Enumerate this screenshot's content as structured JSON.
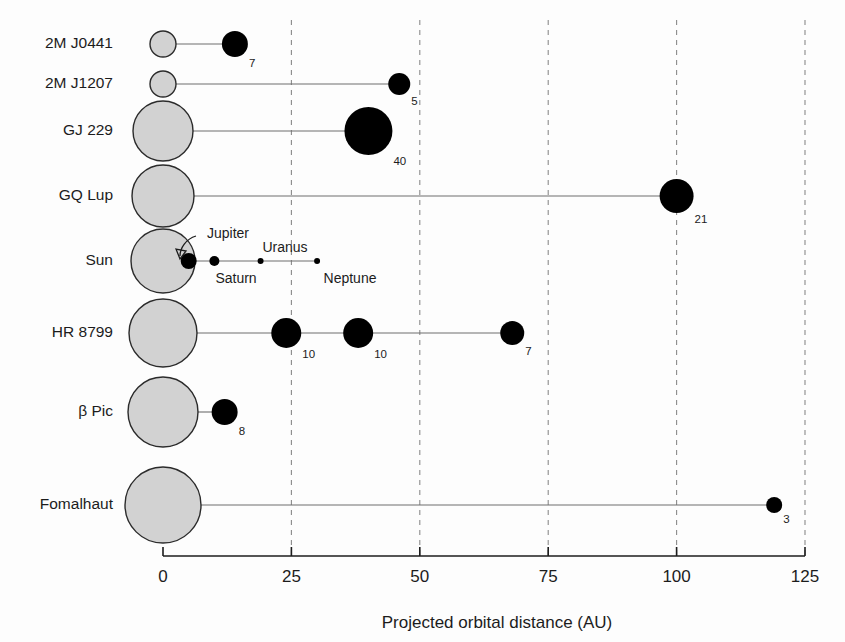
{
  "chart_data": {
    "type": "scatter",
    "title": "",
    "xlabel": "Projected orbital distance (AU)",
    "ylabel": "",
    "xlim": [
      0,
      125
    ],
    "xticks": [
      0,
      25,
      50,
      75,
      100,
      125
    ],
    "xticklabels": [
      "0",
      "25",
      "50",
      "75",
      "100",
      "125"
    ],
    "gridlines": [
      25,
      50,
      75,
      100,
      125
    ],
    "grid": true,
    "legend": "none",
    "categories": [
      "2M J0441",
      "2M J1207",
      "GJ 229",
      "GQ Lup",
      "Sun",
      "HR 8799",
      "β Pic",
      "Fomalhaut"
    ],
    "series": [
      {
        "name": "2M J0441",
        "host_radius_px": 13,
        "y": 44,
        "companions": [
          {
            "x": 14,
            "label": "7",
            "radius_px": 13
          }
        ]
      },
      {
        "name": "2M J1207",
        "host_radius_px": 13,
        "y": 84,
        "companions": [
          {
            "x": 46,
            "label": "5",
            "radius_px": 11
          }
        ]
      },
      {
        "name": "GJ 229",
        "host_radius_px": 30,
        "y": 131,
        "companions": [
          {
            "x": 40,
            "label": "40",
            "radius_px": 24
          }
        ]
      },
      {
        "name": "GQ Lup",
        "host_radius_px": 31,
        "y": 196,
        "companions": [
          {
            "x": 100,
            "label": "21",
            "radius_px": 17
          }
        ]
      },
      {
        "name": "Sun",
        "host_radius_px": 32,
        "y": 261,
        "companions": [
          {
            "x": 5,
            "label": "",
            "radius_px": 8,
            "name": "Jupiter"
          },
          {
            "x": 10,
            "label": "",
            "radius_px": 5,
            "name": "Saturn"
          },
          {
            "x": 19,
            "label": "",
            "radius_px": 3,
            "name": "Uranus"
          },
          {
            "x": 30,
            "label": "",
            "radius_px": 3,
            "name": "Neptune"
          }
        ]
      },
      {
        "name": "HR 8799",
        "host_radius_px": 34,
        "y": 333,
        "companions": [
          {
            "x": 24,
            "label": "10",
            "radius_px": 15
          },
          {
            "x": 38,
            "label": "10",
            "radius_px": 15
          },
          {
            "x": 68,
            "label": "7",
            "radius_px": 12
          }
        ]
      },
      {
        "name": "β Pic",
        "host_radius_px": 35,
        "y": 412,
        "companions": [
          {
            "x": 12,
            "label": "8",
            "radius_px": 13
          }
        ]
      },
      {
        "name": "Fomalhaut",
        "host_radius_px": 38,
        "y": 505,
        "companions": [
          {
            "x": 119,
            "label": "3",
            "radius_px": 8
          }
        ]
      }
    ],
    "annotations": [
      {
        "text": "Jupiter",
        "x_px": 228,
        "y_px": 238,
        "type": "arrow-label"
      },
      {
        "text": "Saturn",
        "x_px": 236,
        "y_px": 283,
        "type": "label"
      },
      {
        "text": "Uranus",
        "x_px": 285,
        "y_px": 252,
        "type": "label"
      },
      {
        "text": "Neptune",
        "x_px": 350,
        "y_px": 283,
        "type": "label"
      }
    ]
  },
  "axis": {
    "title": "Projected orbital distance (AU)",
    "tick_labels": [
      "0",
      "25",
      "50",
      "75",
      "100",
      "125"
    ]
  },
  "row_labels": [
    "2M J0441",
    "2M J1207",
    "GJ 229",
    "GQ Lup",
    "Sun",
    "HR 8799",
    "β Pic",
    "Fomalhaut"
  ],
  "value_labels": [
    "7",
    "5",
    "40",
    "21",
    "10",
    "10",
    "7",
    "8",
    "3"
  ],
  "planet_labels": [
    "Jupiter",
    "Saturn",
    "Uranus",
    "Neptune"
  ],
  "colors": {
    "host_fill": "#d2d2d2",
    "host_stroke": "#2b2b2b",
    "companion_fill": "#000000",
    "connector": "#6e6e6e",
    "gridline": "#8a8a8a",
    "axis": "#1c1c1c",
    "background": "#fdfdfd"
  }
}
